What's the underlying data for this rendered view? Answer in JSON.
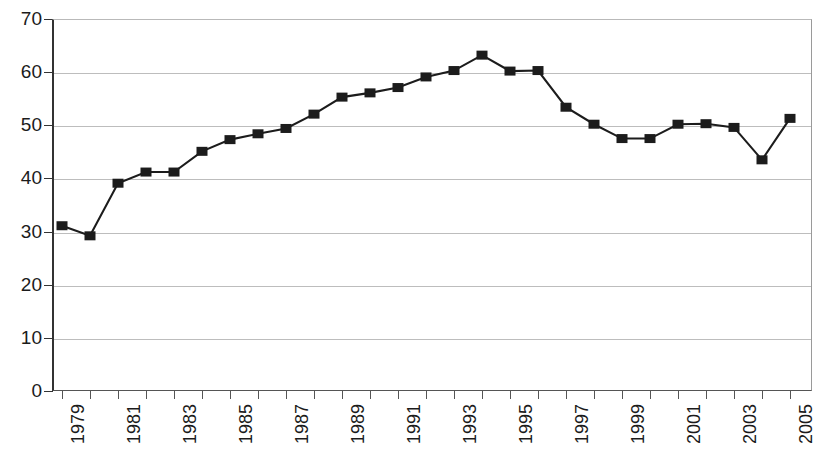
{
  "chart_data": {
    "type": "line",
    "title": "",
    "subtitle": "",
    "xlabel": "",
    "ylabel": "",
    "x": [
      1979,
      1980,
      1981,
      1982,
      1983,
      1984,
      1985,
      1986,
      1987,
      1988,
      1989,
      1990,
      1991,
      1992,
      1993,
      1994,
      1995,
      1996,
      1997,
      1998,
      1999,
      2000,
      2001,
      2002,
      2003,
      2004,
      2005
    ],
    "values": [
      31.1,
      29.2,
      39.1,
      41.2,
      41.2,
      45.1,
      47.3,
      48.4,
      49.4,
      52.1,
      55.3,
      56.1,
      57.1,
      59.1,
      60.3,
      63.2,
      60.2,
      60.3,
      53.4,
      50.2,
      47.5,
      47.5,
      50.2,
      50.3,
      49.6,
      43.5,
      51.3
    ],
    "categories": [
      "1979",
      "1980",
      "1981",
      "1982",
      "1983",
      "1984",
      "1985",
      "1986",
      "1987",
      "1988",
      "1989",
      "1990",
      "1991",
      "1992",
      "1993",
      "1994",
      "1995",
      "1996",
      "1997",
      "1998",
      "1999",
      "2000",
      "2001",
      "2002",
      "2003",
      "2004",
      "2005"
    ],
    "series": [
      {
        "name": "series-1",
        "values": [
          31.1,
          29.2,
          39.1,
          41.2,
          41.2,
          45.1,
          47.3,
          48.4,
          49.4,
          52.1,
          55.3,
          56.1,
          57.1,
          59.1,
          60.3,
          63.2,
          60.2,
          60.3,
          53.4,
          50.2,
          47.5,
          47.5,
          50.2,
          50.3,
          49.6,
          43.5,
          51.3
        ]
      }
    ],
    "xlim": [
      1978.6,
      2005.5
    ],
    "ylim": [
      0,
      70
    ],
    "ytick_labels": [
      "0",
      "10",
      "20",
      "30",
      "40",
      "50",
      "60",
      "70"
    ],
    "ytick_values": [
      0,
      10,
      20,
      30,
      40,
      50,
      60,
      70
    ],
    "xtick_labels": [
      "1979",
      "",
      "1981",
      "",
      "1983",
      "",
      "1985",
      "",
      "1987",
      "",
      "1989",
      "",
      "1991",
      "",
      "1993",
      "",
      "1995",
      "",
      "1997",
      "",
      "1999",
      "",
      "2001",
      "",
      "2003",
      "",
      "2005"
    ],
    "xtick_labels_shown": [
      "1979",
      "1981",
      "1983",
      "1985",
      "1987",
      "1989",
      "1991",
      "1993",
      "1995",
      "1997",
      "1999",
      "2001",
      "2003",
      "2005"
    ],
    "grid": true,
    "grid_axis": "y",
    "legend": false,
    "legend_position": "none",
    "marker": "square",
    "annotations": [],
    "colors": {
      "line": "#1c1c1c",
      "marker": "#1c1c1c",
      "gridline": "#bdbdbd",
      "axis": "#333333",
      "text": "#1b1b1b",
      "background": "#ffffff"
    }
  }
}
